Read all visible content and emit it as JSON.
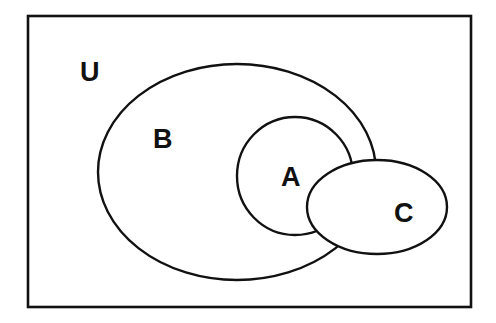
{
  "diagram": {
    "type": "venn",
    "universe": {
      "label": "U",
      "rect": {
        "x": 28,
        "y": 16,
        "width": 443,
        "height": 291
      },
      "label_pos": {
        "x": 80,
        "y": 81
      }
    },
    "sets": [
      {
        "id": "B",
        "label": "B",
        "shape": "ellipse",
        "cx": 237,
        "cy": 172,
        "rx": 139,
        "ry": 108,
        "label_pos": {
          "x": 163,
          "y": 148
        }
      },
      {
        "id": "A",
        "label": "A",
        "shape": "ellipse",
        "cx": 295,
        "cy": 176,
        "rx": 58,
        "ry": 59,
        "label_pos": {
          "x": 292,
          "y": 186
        }
      },
      {
        "id": "C",
        "label": "C",
        "shape": "ellipse",
        "cx": 377,
        "cy": 207,
        "rx": 70,
        "ry": 47,
        "label_pos": {
          "x": 404,
          "y": 222
        }
      }
    ],
    "relationships": [
      "A is a subset of B",
      "C partially overlaps both A and B",
      "All sets lie within universe U"
    ],
    "colors": {
      "stroke": "#111111",
      "fill": "#ffffff",
      "background": "#ffffff"
    }
  }
}
